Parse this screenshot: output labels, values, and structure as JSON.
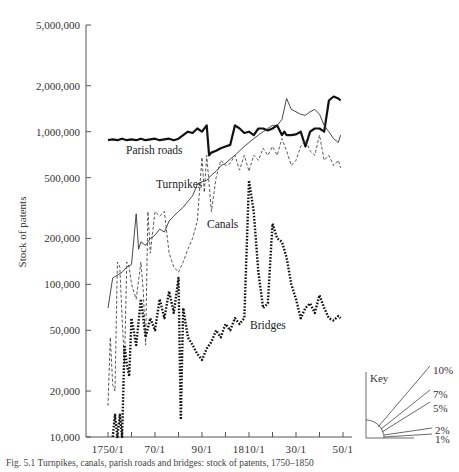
{
  "chart_data": {
    "type": "line",
    "title": "",
    "xlabel": "",
    "ylabel": "Stock of patents",
    "yscale": "log",
    "ylim": [
      10000,
      5000000
    ],
    "yticks": [
      5000000,
      2000000,
      1000000,
      500000,
      200000,
      100000,
      50000,
      20000,
      10000
    ],
    "ytick_labels": [
      "5,000,000",
      "2,000,000",
      "1,000,000",
      "500,000",
      "200,000",
      "100,000",
      "50,000",
      "20,000",
      "10,000"
    ],
    "xlim": [
      1750,
      1850
    ],
    "xticks": [
      1750,
      1760,
      1770,
      1780,
      1790,
      1800,
      1810,
      1820,
      1830,
      1840,
      1850
    ],
    "xtick_labels": [
      "1750/1",
      "70/1",
      "90/1",
      "1810/1",
      "30/1",
      "50/1"
    ],
    "xtick_label_positions": [
      1750,
      1770,
      1790,
      1810,
      1830,
      1850
    ],
    "grid": false,
    "legend": "inline labels",
    "series": [
      {
        "name": "Parish roads",
        "style": "thick solid",
        "x": [
          1750,
          1752,
          1754,
          1756,
          1758,
          1760,
          1762,
          1764,
          1766,
          1768,
          1770,
          1772,
          1774,
          1776,
          1778,
          1780,
          1782,
          1784,
          1786,
          1788,
          1790,
          1792,
          1793,
          1794,
          1796,
          1798,
          1800,
          1802,
          1804,
          1806,
          1808,
          1810,
          1812,
          1814,
          1816,
          1818,
          1820,
          1822,
          1824,
          1825,
          1826,
          1828,
          1830,
          1832,
          1834,
          1836,
          1838,
          1840,
          1842,
          1844,
          1846,
          1848,
          1849
        ],
        "values": [
          880000,
          890000,
          880000,
          900000,
          880000,
          890000,
          880000,
          900000,
          880000,
          890000,
          900000,
          880000,
          890000,
          900000,
          880000,
          900000,
          950000,
          1000000,
          980000,
          1050000,
          1000000,
          1100000,
          700000,
          730000,
          750000,
          780000,
          800000,
          820000,
          1100000,
          1050000,
          980000,
          1000000,
          950000,
          1050000,
          1050000,
          1020000,
          1050000,
          1100000,
          950000,
          1000000,
          950000,
          950000,
          960000,
          1000000,
          800000,
          1000000,
          1050000,
          1050000,
          1000000,
          1600000,
          1700000,
          1650000,
          1600000
        ]
      },
      {
        "name": "Turnpikes",
        "style": "thin solid",
        "x": [
          1750,
          1752,
          1754,
          1756,
          1758,
          1760,
          1762,
          1763,
          1764,
          1766,
          1768,
          1770,
          1772,
          1774,
          1776,
          1778,
          1780,
          1782,
          1784,
          1786,
          1788,
          1790,
          1792,
          1794,
          1796,
          1798,
          1800,
          1802,
          1804,
          1806,
          1808,
          1810,
          1812,
          1814,
          1816,
          1818,
          1820,
          1822,
          1824,
          1826,
          1828,
          1830,
          1832,
          1834,
          1836,
          1838,
          1840,
          1842,
          1844,
          1846,
          1848,
          1849
        ],
        "values": [
          70000,
          110000,
          115000,
          120000,
          130000,
          135000,
          290000,
          170000,
          190000,
          180000,
          200000,
          210000,
          230000,
          220000,
          260000,
          280000,
          300000,
          320000,
          350000,
          380000,
          450000,
          470000,
          480000,
          520000,
          550000,
          600000,
          620000,
          660000,
          700000,
          750000,
          800000,
          850000,
          900000,
          950000,
          1000000,
          1050000,
          1100000,
          1100000,
          1200000,
          1650000,
          1400000,
          1350000,
          1300000,
          1280000,
          1350000,
          1400000,
          1300000,
          1100000,
          1000000,
          900000,
          850000,
          950000
        ]
      },
      {
        "name": "Canals",
        "style": "thin dashed",
        "x": [
          1750,
          1751,
          1752,
          1753,
          1754,
          1755,
          1756,
          1757,
          1758,
          1759,
          1760,
          1762,
          1764,
          1765,
          1766,
          1767,
          1768,
          1770,
          1772,
          1774,
          1776,
          1778,
          1780,
          1782,
          1784,
          1786,
          1788,
          1790,
          1791,
          1792,
          1794,
          1796,
          1798,
          1800,
          1802,
          1804,
          1806,
          1808,
          1810,
          1812,
          1814,
          1816,
          1818,
          1820,
          1822,
          1824,
          1826,
          1828,
          1830,
          1832,
          1834,
          1836,
          1838,
          1840,
          1842,
          1844,
          1846,
          1848,
          1849
        ],
        "values": [
          16000,
          45000,
          22000,
          20000,
          140000,
          130000,
          60000,
          30000,
          140000,
          130000,
          100000,
          80000,
          140000,
          90000,
          40000,
          300000,
          160000,
          300000,
          280000,
          300000,
          160000,
          130000,
          120000,
          140000,
          170000,
          200000,
          260000,
          680000,
          400000,
          700000,
          300000,
          500000,
          650000,
          600000,
          620000,
          700000,
          560000,
          700000,
          550000,
          700000,
          650000,
          780000,
          700000,
          800000,
          700000,
          900000,
          750000,
          600000,
          650000,
          800000,
          880000,
          750000,
          700000,
          950000,
          650000,
          700000,
          600000,
          650000,
          580000
        ]
      },
      {
        "name": "Bridges",
        "style": "thick dotted",
        "x": [
          1752,
          1753,
          1754,
          1755,
          1756,
          1757,
          1758,
          1759,
          1760,
          1762,
          1764,
          1766,
          1768,
          1770,
          1772,
          1774,
          1776,
          1778,
          1780,
          1781,
          1782,
          1784,
          1786,
          1788,
          1790,
          1792,
          1794,
          1796,
          1798,
          1800,
          1802,
          1804,
          1806,
          1808,
          1810,
          1812,
          1814,
          1816,
          1818,
          1820,
          1822,
          1824,
          1826,
          1828,
          1830,
          1832,
          1834,
          1836,
          1838,
          1840,
          1842,
          1844,
          1846,
          1848,
          1849
        ],
        "values": [
          10000,
          14000,
          10000,
          14000,
          10000,
          40000,
          30000,
          25000,
          60000,
          40000,
          80000,
          45000,
          60000,
          50000,
          80000,
          60000,
          90000,
          65000,
          110000,
          13000,
          70000,
          45000,
          40000,
          35000,
          32000,
          38000,
          42000,
          50000,
          45000,
          55000,
          50000,
          60000,
          55000,
          60000,
          480000,
          300000,
          120000,
          70000,
          75000,
          250000,
          200000,
          190000,
          150000,
          100000,
          80000,
          60000,
          70000,
          75000,
          65000,
          85000,
          70000,
          60000,
          58000,
          62000,
          60000
        ]
      }
    ],
    "key": {
      "title": "Key",
      "growth_rates": [
        "10%",
        "7%",
        "5%",
        "2%",
        "1%"
      ]
    },
    "annotations": [
      "Parish roads",
      "Turnpikes",
      "Canals",
      "Bridges"
    ]
  },
  "caption": {
    "text": "Fig. 5.1  Turnpikes, canals, parish roads and bridges: stock of patents, 1750–1850"
  }
}
